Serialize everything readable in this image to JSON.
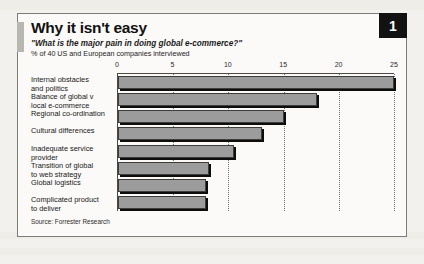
{
  "figure": {
    "badge_number": "1",
    "title": "Why it isn't easy",
    "subtitle": "\"What is the major pain in doing global e-commerce?\"",
    "units": "% of 40 US and European companies interviewed",
    "source": "Source: Forrester Research",
    "colors": {
      "bar_fill": "#9c9c9c",
      "bar_outline": "#3d3d3d",
      "bar_shadow": "#0d0d0d",
      "badge_background": "#121212",
      "badge_text": "#ffffff",
      "panel_background": "#fbfaf8",
      "page_background": "#f2f1ee",
      "frame_border": "#7d7d78",
      "gridline": "#6e6e6e"
    }
  },
  "chart_data": {
    "type": "bar",
    "orientation": "horizontal",
    "title": "Why it isn't easy",
    "subtitle": "\"What is the major pain in doing global e-commerce?\"",
    "xlabel": "% of 40 US and European companies interviewed",
    "ylabel": "",
    "xlim": [
      0,
      25
    ],
    "ticks": [
      0,
      5,
      10,
      15,
      20,
      25
    ],
    "tick_labels": [
      "0",
      "5",
      "10",
      "15",
      "20",
      "25"
    ],
    "grid": true,
    "legend": false,
    "categories": [
      "Internal obstacles and politics",
      "Balance of global v local e-commerce",
      "Regional co-ordination",
      "Cultural differences",
      "Inadequate service provider",
      "Transition of global to web strategy",
      "Global logistics",
      "Complicated product to deliver"
    ],
    "category_lines": [
      [
        "Internal obstacles",
        "and politics"
      ],
      [
        "Balance of global v",
        "local e-commerce"
      ],
      [
        "Regional co-ordination"
      ],
      [
        "Cultural differences"
      ],
      [
        "Inadequate service",
        "provider"
      ],
      [
        "Transition of global",
        "to web strategy"
      ],
      [
        "Global logistics"
      ],
      [
        "Complicated product",
        "to deliver"
      ]
    ],
    "values": [
      25,
      18,
      15,
      13,
      10.5,
      8.2,
      8,
      8
    ]
  }
}
